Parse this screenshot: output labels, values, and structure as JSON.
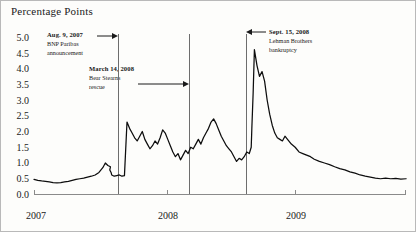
{
  "chart_data": {
    "type": "line",
    "title": "Percentage Points",
    "xlabel": "",
    "ylabel": "Percentage Points",
    "ylim": [
      0.0,
      5.0
    ],
    "xlim": [
      2007.0,
      2009.92
    ],
    "grid": false,
    "legend": "none",
    "ytick_labels": [
      "0.0",
      "0.5",
      "1.0",
      "1.5",
      "2.0",
      "2.5",
      "3.0",
      "3.5",
      "4.0",
      "4.5",
      "5.0"
    ],
    "ytick_values": [
      0.0,
      0.5,
      1.0,
      1.5,
      2.0,
      2.5,
      3.0,
      3.5,
      4.0,
      4.5,
      5.0
    ],
    "xtick_labels": [
      "2007",
      "2008",
      "2009"
    ],
    "xtick_values": [
      2007.0,
      2008.0,
      2009.0
    ],
    "series": [
      {
        "name": "spread",
        "x": [
          2007.0,
          2007.03,
          2007.06,
          2007.09,
          2007.12,
          2007.15,
          2007.18,
          2007.21,
          2007.24,
          2007.27,
          2007.3,
          2007.33,
          2007.36,
          2007.39,
          2007.42,
          2007.45,
          2007.48,
          2007.51,
          2007.54,
          2007.56,
          2007.58,
          2007.6,
          2007.595,
          2007.605,
          2007.61,
          2007.63,
          2007.65,
          2007.67,
          2007.69,
          2007.71,
          2007.73,
          2007.75,
          2007.77,
          2007.79,
          2007.81,
          2007.83,
          2007.85,
          2007.87,
          2007.89,
          2007.91,
          2007.93,
          2007.95,
          2007.97,
          2007.99,
          2008.01,
          2008.03,
          2008.05,
          2008.07,
          2008.09,
          2008.11,
          2008.13,
          2008.15,
          2008.17,
          2008.19,
          2008.21,
          2008.23,
          2008.25,
          2008.27,
          2008.29,
          2008.31,
          2008.33,
          2008.35,
          2008.37,
          2008.39,
          2008.41,
          2008.43,
          2008.45,
          2008.47,
          2008.49,
          2008.51,
          2008.53,
          2008.55,
          2008.57,
          2008.59,
          2008.61,
          2008.63,
          2008.65,
          2008.67,
          2008.69,
          2008.705,
          2008.71,
          2008.72,
          2008.73,
          2008.75,
          2008.77,
          2008.79,
          2008.81,
          2008.83,
          2008.85,
          2008.87,
          2008.89,
          2008.91,
          2008.93,
          2008.95,
          2008.97,
          2008.99,
          2009.02,
          2009.05,
          2009.08,
          2009.11,
          2009.14,
          2009.17,
          2009.2,
          2009.24,
          2009.28,
          2009.32,
          2009.36,
          2009.4,
          2009.44,
          2009.48,
          2009.52,
          2009.56,
          2009.6,
          2009.64,
          2009.68,
          2009.72,
          2009.76,
          2009.8,
          2009.84,
          2009.88,
          2009.92
        ],
        "y": [
          0.48,
          0.45,
          0.43,
          0.42,
          0.4,
          0.38,
          0.37,
          0.38,
          0.4,
          0.42,
          0.45,
          0.48,
          0.5,
          0.52,
          0.55,
          0.58,
          0.62,
          0.7,
          0.85,
          1.0,
          0.92,
          0.88,
          0.78,
          0.7,
          0.62,
          0.58,
          0.6,
          0.62,
          0.58,
          0.6,
          2.3,
          2.1,
          1.95,
          1.8,
          1.7,
          1.85,
          2.0,
          1.75,
          1.6,
          1.45,
          1.55,
          1.7,
          1.6,
          1.8,
          2.05,
          1.95,
          1.75,
          1.55,
          1.35,
          1.2,
          1.3,
          1.1,
          1.25,
          1.4,
          1.3,
          1.5,
          1.45,
          1.6,
          1.75,
          1.6,
          1.8,
          1.95,
          2.1,
          2.3,
          2.4,
          2.25,
          2.05,
          1.85,
          1.7,
          1.55,
          1.45,
          1.35,
          1.2,
          1.05,
          1.15,
          1.1,
          1.2,
          1.35,
          1.3,
          1.5,
          2.1,
          3.2,
          4.6,
          4.1,
          3.75,
          3.9,
          3.6,
          3.0,
          2.55,
          2.2,
          1.95,
          1.8,
          1.75,
          1.7,
          1.85,
          1.75,
          1.6,
          1.5,
          1.35,
          1.3,
          1.25,
          1.2,
          1.12,
          1.05,
          1.0,
          0.95,
          0.88,
          0.82,
          0.78,
          0.72,
          0.68,
          0.62,
          0.58,
          0.55,
          0.52,
          0.5,
          0.52,
          0.5,
          0.51,
          0.49,
          0.5
        ],
        "color": "#0d0d0d"
      }
    ],
    "event_lines": [
      {
        "id": "bnp",
        "x": 2007.605,
        "color": "#6d6d6d"
      },
      {
        "id": "bear-stearns",
        "x": 2008.2,
        "color": "#6d6d6d"
      },
      {
        "id": "lehman",
        "x": 2008.71,
        "color": "#6d6d6d"
      }
    ],
    "annotations": [
      {
        "id": "bnp",
        "heading": "Aug. 9, 2007",
        "line2": "BNP Paribas",
        "line3": "announcement",
        "arrow_direction": "right"
      },
      {
        "id": "bear-stearns",
        "heading": "March 14, 2008",
        "line2": "Bear Stearns",
        "line3": "rescue",
        "arrow_direction": "right"
      },
      {
        "id": "lehman",
        "heading": "Sept. 15, 2008",
        "line2": "Lehman Brothers",
        "line3": "bankruptcy",
        "arrow_direction": "left"
      }
    ]
  },
  "axis": {
    "title": "Percentage Points",
    "y_labels": [
      "5.0",
      "4.5",
      "4.0",
      "3.5",
      "3.0",
      "2.5",
      "2.0",
      "1.5",
      "1.0",
      "0.5",
      "0.0"
    ],
    "x_labels": [
      "2007",
      "2008",
      "2009"
    ]
  }
}
